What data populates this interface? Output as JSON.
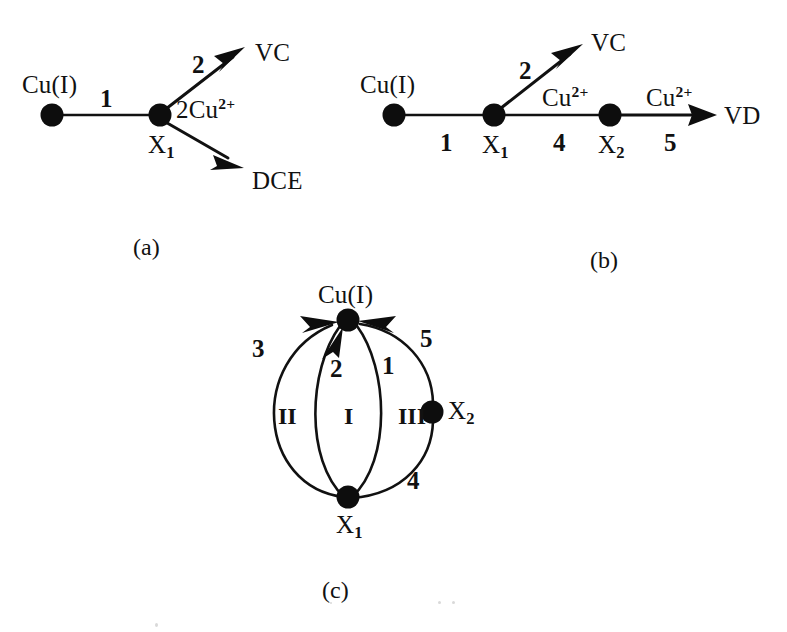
{
  "figure": {
    "background_color": "#ffffff",
    "ink_color": "#111111",
    "node_color": "#0d0d0d"
  },
  "panels": [
    {
      "id": "a",
      "caption": "(a)",
      "nodes": [
        {
          "id": "cu1_a",
          "label": "Cu(I)",
          "x": 52,
          "y": 115,
          "r": 11,
          "label_x": 22,
          "label_y": 72
        },
        {
          "id": "x1_a",
          "label_base": "X",
          "label_sub": "1",
          "x": 160,
          "y": 115,
          "r": 11,
          "label_x": 148,
          "label_y": 132
        }
      ],
      "edges": [
        {
          "id": "a-edge-1",
          "step": "1",
          "from": "cu1_a",
          "to": "x1_a",
          "arrow": false,
          "step_x": 100,
          "step_y": 86
        },
        {
          "id": "a-edge-2",
          "step": "2",
          "from": "x1_a",
          "to": "vc_a",
          "arrow": true,
          "step_x": 192,
          "step_y": 52
        },
        {
          "id": "a-edge-2cu",
          "step": "",
          "from": "x1_a",
          "to": "dce_a",
          "arrow": true,
          "step_x": 0,
          "step_y": 0
        }
      ],
      "terminals": [
        {
          "id": "vc_a",
          "label": "VC",
          "x": 255,
          "y": 40,
          "tip_x": 240,
          "tip_y": 52
        },
        {
          "id": "dce_a",
          "label": "DCE",
          "x": 252,
          "y": 168,
          "tip_x": 245,
          "tip_y": 163
        }
      ],
      "annotations": [
        {
          "id": "a-reagent",
          "base": "2Cu",
          "sup": "2+",
          "x": 176,
          "y": 96
        }
      ],
      "caption_x": 133,
      "caption_y": 235
    },
    {
      "id": "b",
      "caption": "(b)",
      "nodes": [
        {
          "id": "cu1_b",
          "label": "Cu(I)",
          "x": 394,
          "y": 115,
          "r": 11,
          "label_x": 360,
          "label_y": 72
        },
        {
          "id": "x1_b",
          "label_base": "X",
          "label_sub": "1",
          "x": 494,
          "y": 115,
          "r": 11,
          "label_x": 482,
          "label_y": 132
        },
        {
          "id": "x2_b",
          "label_base": "X",
          "label_sub": "2",
          "x": 610,
          "y": 115,
          "r": 11,
          "label_x": 598,
          "label_y": 132
        }
      ],
      "edges": [
        {
          "id": "b-edge-1",
          "step": "1",
          "from": "cu1_b",
          "to": "x1_b",
          "arrow": false,
          "step_x": 440,
          "step_y": 130
        },
        {
          "id": "b-edge-2",
          "step": "2",
          "from": "x1_b",
          "to": "vc_b",
          "arrow": true,
          "step_x": 519,
          "step_y": 58
        },
        {
          "id": "b-edge-4",
          "step": "4",
          "from": "x1_b",
          "to": "x2_b",
          "arrow": false,
          "step_x": 553,
          "step_y": 130
        },
        {
          "id": "b-edge-5",
          "step": "5",
          "from": "x2_b",
          "to": "vd_b",
          "arrow": true,
          "step_x": 664,
          "step_y": 130
        }
      ],
      "terminals": [
        {
          "id": "vc_b",
          "label": "VC",
          "x": 591,
          "y": 30,
          "tip_x": 578,
          "tip_y": 48
        },
        {
          "id": "vd_b",
          "label": "VD",
          "x": 724,
          "y": 103,
          "tip_x": 714,
          "tip_y": 115
        }
      ],
      "annotations": [
        {
          "id": "b-reagent-4",
          "base": "Cu",
          "sup": "2+",
          "x": 542,
          "y": 84
        },
        {
          "id": "b-reagent-5",
          "base": "Cu",
          "sup": "2+",
          "x": 646,
          "y": 84
        }
      ],
      "caption_x": 590,
      "caption_y": 248
    },
    {
      "id": "c",
      "caption": "(c)",
      "nodes": [
        {
          "id": "cu1_c",
          "label": "Cu(I)",
          "x": 348,
          "y": 320,
          "r": 11,
          "label_x": 318,
          "label_y": 282
        },
        {
          "id": "x1_c",
          "label_base": "X",
          "label_sub": "1",
          "x": 348,
          "y": 497,
          "r": 11,
          "label_x": 336,
          "label_y": 512
        },
        {
          "id": "x2_c",
          "label_base": "X",
          "label_sub": "2",
          "x": 432,
          "y": 412,
          "r": 11,
          "label_x": 448,
          "label_y": 398
        }
      ],
      "edges": [
        {
          "id": "c-edge-3",
          "step": "3",
          "step_x": 252,
          "step_y": 336
        },
        {
          "id": "c-edge-2",
          "step": "2",
          "step_x": 330,
          "step_y": 356
        },
        {
          "id": "c-edge-1",
          "step": "1",
          "step_x": 382,
          "step_y": 353
        },
        {
          "id": "c-edge-5",
          "step": "5",
          "step_x": 420,
          "step_y": 326
        },
        {
          "id": "c-edge-4",
          "step": "4",
          "step_x": 407,
          "step_y": 468
        }
      ],
      "loops": [
        {
          "id": "loop-II",
          "label": "II",
          "x": 278,
          "y": 404
        },
        {
          "id": "loop-I",
          "label": "I",
          "x": 344,
          "y": 404
        },
        {
          "id": "loop-III",
          "label": "III",
          "x": 398,
          "y": 404
        }
      ],
      "caption_x": 322,
      "caption_y": 578
    }
  ]
}
